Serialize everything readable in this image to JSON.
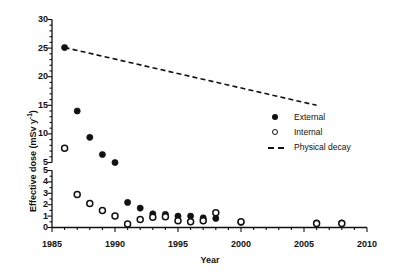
{
  "chart_data": {
    "type": "scatter",
    "title": "",
    "xlabel": "Year",
    "ylabel": "Effective dose (mSv y-1)",
    "ylabel_html": "Effective dose (mSv y⁻¹)",
    "xlim": [
      1985,
      2010
    ],
    "xticks": [
      1985,
      1990,
      1995,
      2000,
      2005,
      2010
    ],
    "xticklabels": [
      "1985",
      "1990",
      "1995",
      "2000",
      "2005",
      "2010"
    ],
    "x_minor_tick_step": 1,
    "broken_y_axis": true,
    "y_upper": {
      "range": [
        5,
        30
      ],
      "ticks": [
        5,
        10,
        15,
        20,
        25,
        30
      ],
      "ticklabels": [
        "5",
        "10",
        "15",
        "20",
        "25",
        "30"
      ],
      "minor_tick_step": 1
    },
    "y_lower": {
      "range": [
        0,
        5
      ],
      "ticks": [
        0,
        1,
        2,
        3,
        4,
        5
      ],
      "ticklabels": [
        "0",
        "1",
        "2",
        "3",
        "4",
        "5"
      ],
      "minor_tick_step": 0.5
    },
    "grid": false,
    "legend_position": "upper right",
    "series": [
      {
        "name": "External",
        "marker": "filled-circle",
        "color": "#111111",
        "points": [
          {
            "x": 1986,
            "y": 25.1
          },
          {
            "x": 1987,
            "y": 14.0
          },
          {
            "x": 1988,
            "y": 9.4
          },
          {
            "x": 1989,
            "y": 6.4
          },
          {
            "x": 1990,
            "y": 5.0
          },
          {
            "x": 1991,
            "y": 2.2
          },
          {
            "x": 1992,
            "y": 1.7
          },
          {
            "x": 1993,
            "y": 1.2
          },
          {
            "x": 1994,
            "y": 1.15
          },
          {
            "x": 1995,
            "y": 1.0
          },
          {
            "x": 1996,
            "y": 1.0
          },
          {
            "x": 1997,
            "y": 0.85
          },
          {
            "x": 1998,
            "y": 0.8
          },
          {
            "x": 2000,
            "y": 0.45
          },
          {
            "x": 2006,
            "y": 0.4
          },
          {
            "x": 2008,
            "y": 0.4
          }
        ]
      },
      {
        "name": "Internal",
        "marker": "open-circle",
        "color": "#111111",
        "points": [
          {
            "x": 1986,
            "y": 7.5
          },
          {
            "x": 1987,
            "y": 2.9
          },
          {
            "x": 1988,
            "y": 2.1
          },
          {
            "x": 1989,
            "y": 1.5
          },
          {
            "x": 1990,
            "y": 1.0
          },
          {
            "x": 1991,
            "y": 0.3
          },
          {
            "x": 1992,
            "y": 0.7
          },
          {
            "x": 1993,
            "y": 0.9
          },
          {
            "x": 1994,
            "y": 0.95
          },
          {
            "x": 1995,
            "y": 0.6
          },
          {
            "x": 1996,
            "y": 0.5
          },
          {
            "x": 1997,
            "y": 0.6
          },
          {
            "x": 1998,
            "y": 1.3
          },
          {
            "x": 2000,
            "y": 0.5
          },
          {
            "x": 2006,
            "y": 0.35
          },
          {
            "x": 2008,
            "y": 0.35
          }
        ]
      },
      {
        "name": "Physical decay",
        "marker": "dashed-line",
        "color": "#111111",
        "points": [
          {
            "x": 1986,
            "y": 25.1
          },
          {
            "x": 2006,
            "y": 15.0
          }
        ]
      }
    ],
    "legend": [
      {
        "label": "External",
        "marker": "filled-circle"
      },
      {
        "label": "Internal",
        "marker": "open-circle"
      },
      {
        "label": "Physical decay",
        "marker": "dashed-line"
      }
    ]
  }
}
